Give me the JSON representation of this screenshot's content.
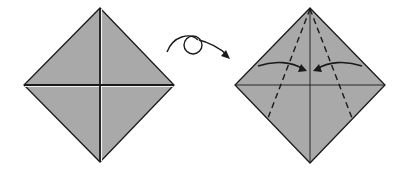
{
  "diagram": {
    "type": "origami-step",
    "steps": [
      {
        "name": "step-before",
        "shape": "square-diamond",
        "creases": [
          "vertical-diagonal",
          "horizontal-diagonal"
        ],
        "crease_style": "folded-with-highlight"
      },
      {
        "name": "step-after",
        "shape": "square-diamond",
        "creases": [
          "vertical-diagonal",
          "horizontal-diagonal"
        ],
        "fold_lines": [
          "left-valley-fold-dashed",
          "right-valley-fold-dashed"
        ],
        "arrows": [
          "fold-left-edge-to-center",
          "fold-right-edge-to-center"
        ]
      }
    ],
    "transition_symbol": "turn-over-arrow",
    "colors": {
      "paper": "#a9a9a9",
      "line": "#1a1a1a",
      "highlight": "#f2f2f2",
      "background": "#ffffff"
    }
  }
}
